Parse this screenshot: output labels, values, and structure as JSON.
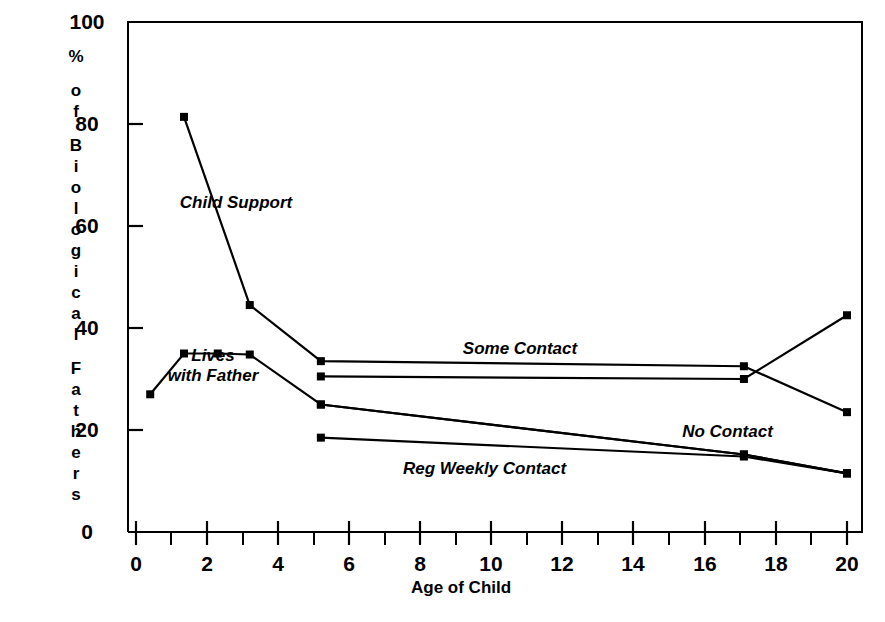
{
  "chart_data": {
    "type": "line",
    "title": "",
    "xlabel": "Age of Child",
    "ylabel": "% of Biological Fathers",
    "xlim": [
      0,
      20
    ],
    "ylim": [
      0,
      100
    ],
    "grid": false,
    "legend_position": "inline-annotations",
    "xticks": [
      0,
      2,
      4,
      6,
      8,
      10,
      12,
      14,
      16,
      18,
      20
    ],
    "xtick_labels": [
      "0",
      "2",
      "4",
      "6",
      "8",
      "10",
      "12",
      "14",
      "16",
      "18",
      "20"
    ],
    "xminor_ticks": [
      1,
      3,
      5,
      7,
      9,
      11,
      13,
      15,
      17,
      19
    ],
    "yticks": [
      0,
      20,
      40,
      60,
      80,
      100
    ],
    "ytick_labels": [
      "0",
      "20",
      "40",
      "60",
      "80",
      "100"
    ],
    "marker": "square",
    "series": [
      {
        "name": "Child Support",
        "x": [
          1.35,
          3.2,
          5.2,
          17.1,
          20.0
        ],
        "y": [
          81.4,
          44.5,
          33.5,
          32.5,
          23.5
        ]
      },
      {
        "name": "Lives with Father",
        "x": [
          0.4,
          1.35,
          2.3,
          3.2,
          5.2,
          17.1,
          20.0
        ],
        "y": [
          27.0,
          35.0,
          35.0,
          34.8,
          25.0,
          15.2,
          11.5
        ]
      },
      {
        "name": "Some Contact",
        "x": [
          5.2,
          17.1,
          20.0
        ],
        "y": [
          30.5,
          30.0,
          42.5
        ]
      },
      {
        "name": "No Contact",
        "x": [
          5.2,
          17.1,
          20.0
        ],
        "y": [
          18.5,
          14.8,
          11.5
        ]
      },
      {
        "name": "Reg Weekly Contact",
        "x": [
          5.2,
          17.1,
          20.0
        ],
        "y": [
          25.0,
          15.2,
          11.5
        ]
      }
    ],
    "annotations": [
      {
        "text": "Child Support",
        "x_px": 231,
        "y_px": 205
      },
      {
        "text": "Lives\nwith Father",
        "x_px": 208,
        "y_px": 362
      },
      {
        "text": "Some Contact",
        "x_px": 518,
        "y_px": 351
      },
      {
        "text": "No Contact",
        "x_px": 727,
        "y_px": 434
      },
      {
        "text": "Reg Weekly Contact",
        "x_px": 484,
        "y_px": 471
      }
    ]
  },
  "axes": {
    "y_axis_label_chars": [
      "%",
      "",
      "o",
      "f",
      "",
      "B",
      "i",
      "o",
      "l",
      "o",
      "g",
      "i",
      "c",
      "a",
      "l",
      "",
      "F",
      "a",
      "t",
      "h",
      "e",
      "r",
      "s"
    ],
    "x_axis_title": "Age of Child"
  },
  "annotation_labels": {
    "child_support": "Child Support",
    "lives_with_father_line1": "Lives",
    "lives_with_father_line2": "with Father",
    "some_contact": "Some Contact",
    "no_contact": "No Contact",
    "reg_weekly_contact": "Reg Weekly Contact"
  },
  "ytick_labels": {
    "t0": "0",
    "t20": "20",
    "t40": "40",
    "t60": "60",
    "t80": "80",
    "t100": "100"
  },
  "xtick_labels": {
    "t0": "0",
    "t2": "2",
    "t4": "4",
    "t6": "6",
    "t8": "8",
    "t10": "10",
    "t12": "12",
    "t14": "14",
    "t16": "16",
    "t18": "18",
    "t20": "20"
  },
  "colors": {
    "ink": "#000000",
    "background": "#ffffff"
  }
}
